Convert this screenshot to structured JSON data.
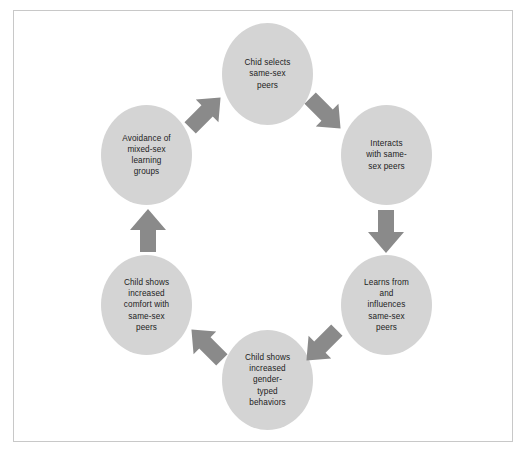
{
  "diagram": {
    "shape": "circular-flow",
    "colors": {
      "page_background": "#ffffff",
      "frame_border": "#c8c8c8",
      "node_fill": "#d4d4d4",
      "arrow_fill": "#8a8a8a",
      "text": "#1c1c1c"
    },
    "nodes": [
      {
        "id": "child-selects-same-sex-peers",
        "text": "Chid selects\nsame-sex\npeers",
        "position": "top",
        "x": 222,
        "y": 23,
        "width": 91,
        "height": 102
      },
      {
        "id": "interacts-with-same-sex-peers",
        "text": "Interacts\nwith same-\nsex peers",
        "position": "top-right",
        "x": 341,
        "y": 105,
        "width": 91,
        "height": 100
      },
      {
        "id": "learns-from-and-influences-same-sex-peers",
        "text": "Learns from\nand\ninfluences\nsame-sex\npeers",
        "position": "bottom-right",
        "x": 341,
        "y": 255,
        "width": 91,
        "height": 100
      },
      {
        "id": "child-shows-increased-gender-typed-behaviors",
        "text": "Child shows\nincreased\ngender-\ntyped\nbehaviors",
        "position": "bottom",
        "x": 222,
        "y": 330,
        "width": 91,
        "height": 100
      },
      {
        "id": "child-shows-increased-comfort-with-same-sex-peers",
        "text": "Child shows\nincreased\ncomfort with\nsame-sex\npeers",
        "position": "bottom-left",
        "x": 101,
        "y": 255,
        "width": 91,
        "height": 100
      },
      {
        "id": "avoidance-of-mixed-sex-learning-groups",
        "text": "Avoidance of\nmixed-sex\nlearning\ngroups",
        "position": "top-left",
        "x": 101,
        "y": 105,
        "width": 91,
        "height": 100
      }
    ],
    "arrows": [
      {
        "id": "arrow-avoidance-to-child-selects",
        "from": "avoidance-of-mixed-sex-learning-groups",
        "to": "child-selects-same-sex-peers",
        "direction": "up-right"
      },
      {
        "id": "arrow-child-selects-to-interacts",
        "from": "child-selects-same-sex-peers",
        "to": "interacts-with-same-sex-peers",
        "direction": "down-right"
      },
      {
        "id": "arrow-interacts-to-learns",
        "from": "interacts-with-same-sex-peers",
        "to": "learns-from-and-influences-same-sex-peers",
        "direction": "down"
      },
      {
        "id": "arrow-learns-to-gender-typed",
        "from": "learns-from-and-influences-same-sex-peers",
        "to": "child-shows-increased-gender-typed-behaviors",
        "direction": "down-left"
      },
      {
        "id": "arrow-gender-typed-to-comfort",
        "from": "child-shows-increased-gender-typed-behaviors",
        "to": "child-shows-increased-comfort-with-same-sex-peers",
        "direction": "up-left"
      },
      {
        "id": "arrow-comfort-to-avoidance",
        "from": "child-shows-increased-comfort-with-same-sex-peers",
        "to": "avoidance-of-mixed-sex-learning-groups",
        "direction": "up"
      }
    ]
  }
}
